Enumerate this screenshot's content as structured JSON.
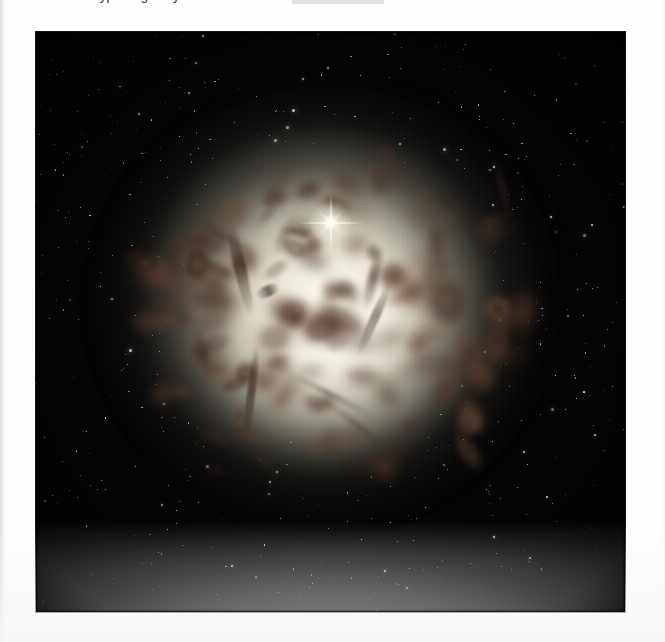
{
  "page": {
    "background_color": "#fefefe",
    "kind": "scanned-book-page"
  },
  "caption": {
    "partial_text": "type of galaxy",
    "note": "line is clipped at top edge of screenshot; only letter descenders visible",
    "highlight_color": "#c9cbd2"
  },
  "photo": {
    "name": "astronomy-photograph",
    "alt": "Hubble Space Telescope image of a giant elliptical galaxy with dark dust lanes crossing a bright cream-white core, surrounded by a faint starry halo on a black sky",
    "frame": {
      "x": 36,
      "y": 32,
      "width": 589,
      "height": 580
    },
    "sky_color": "#030304",
    "core_color": "#f0ecdd",
    "halo_color": "#a8a494",
    "dust_color": "#6b4a38",
    "dust_dark_color": "#33211a",
    "star_color": "#ffffff",
    "bright_star": {
      "x": 295,
      "y": 191,
      "label": "foreground-star-with-diffraction-spikes"
    },
    "features": [
      "bright cream-colored elliptical core",
      "complex reddish-brown dust lanes",
      "diffuse outer halo fading to black",
      "scattered foreground and globular-cluster stars"
    ]
  },
  "chart_data": {
    "type": "heatmap",
    "title": "",
    "note": "photographic image, not a plotted chart"
  }
}
